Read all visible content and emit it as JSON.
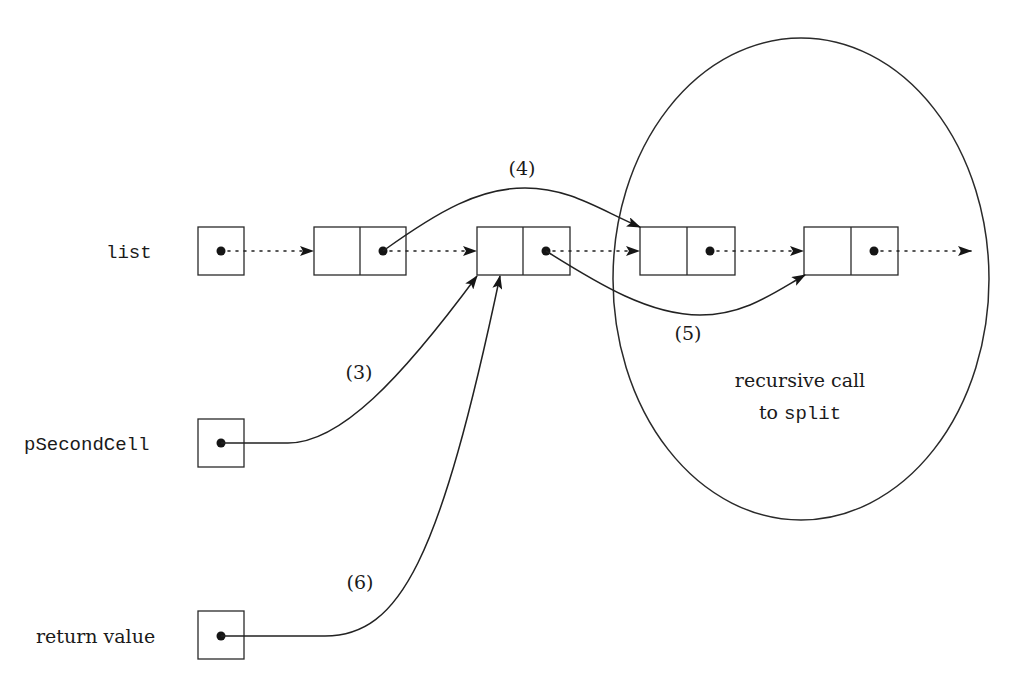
{
  "figure": {
    "type": "linked-list pointer diagram",
    "caption_partial": "Fig. 2.xx ... of function split (caption cropped at bottom edge)"
  },
  "labels": {
    "list": "list",
    "pSecondCell": "pSecondCell",
    "return_value": "return value"
  },
  "step_labels": {
    "s3": "(3)",
    "s4": "(4)",
    "s5": "(5)",
    "s6": "(6)"
  },
  "recursive": {
    "line1": "recursive call",
    "line2_prefix": "to ",
    "line2_code": "split"
  },
  "nodes": [
    {
      "id": "list-var",
      "kind": "pointer-box",
      "has_pointer": true
    },
    {
      "id": "cell-1",
      "kind": "list-cell",
      "fields": [
        "element",
        "next"
      ]
    },
    {
      "id": "cell-2",
      "kind": "list-cell",
      "fields": [
        "element",
        "next"
      ]
    },
    {
      "id": "cell-3",
      "kind": "list-cell",
      "fields": [
        "element",
        "next"
      ],
      "inside_recursive_call": true
    },
    {
      "id": "cell-4",
      "kind": "list-cell",
      "fields": [
        "element",
        "next"
      ],
      "inside_recursive_call": true
    },
    {
      "id": "pSecondCell-var",
      "kind": "pointer-box",
      "has_pointer": true
    },
    {
      "id": "return-value-var",
      "kind": "pointer-box",
      "has_pointer": true
    }
  ],
  "edges": [
    {
      "from": "list-var",
      "to": "cell-1",
      "style": "dotted",
      "label": ""
    },
    {
      "from": "cell-1",
      "to": "cell-2",
      "style": "dotted",
      "label": ""
    },
    {
      "from": "cell-2",
      "to": "cell-3",
      "style": "dotted",
      "label": ""
    },
    {
      "from": "cell-3",
      "to": "cell-4",
      "style": "dotted",
      "label": ""
    },
    {
      "from": "cell-4",
      "to": "continuation",
      "style": "dotted",
      "label": ""
    },
    {
      "from": "cell-1",
      "to": "cell-3",
      "style": "solid",
      "label": "(4)"
    },
    {
      "from": "cell-2",
      "to": "cell-4",
      "style": "solid",
      "label": "(5)"
    },
    {
      "from": "pSecondCell-var",
      "to": "cell-2",
      "style": "solid",
      "label": "(3)"
    },
    {
      "from": "return-value-var",
      "to": "cell-2",
      "style": "solid",
      "label": "(6)"
    }
  ],
  "colors": {
    "stroke": "#222222",
    "background": "#ffffff"
  }
}
